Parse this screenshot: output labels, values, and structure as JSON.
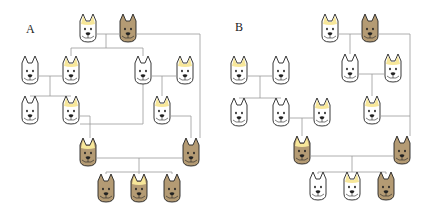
{
  "figure": {
    "colors": {
      "white_coat": "#ffffff",
      "brown_coat": "#b49b74",
      "crest": "#f7e79a",
      "outline": "#222222",
      "line": "#999999"
    },
    "legend_traits": {
      "coat": [
        "white",
        "brown"
      ],
      "crest": [
        "present",
        "absent"
      ]
    }
  },
  "panels": [
    {
      "label": "A",
      "individuals": [
        {
          "id": "A1",
          "generation": 1,
          "coat": "white",
          "crest": true
        },
        {
          "id": "A2",
          "generation": 1,
          "coat": "brown",
          "crest": false
        },
        {
          "id": "A3",
          "generation": 2,
          "coat": "white",
          "crest": false
        },
        {
          "id": "A4",
          "generation": 2,
          "coat": "white",
          "crest": true
        },
        {
          "id": "A5",
          "generation": 2,
          "coat": "white",
          "crest": false
        },
        {
          "id": "A6",
          "generation": 2,
          "coat": "white",
          "crest": true
        },
        {
          "id": "A7",
          "generation": 3,
          "coat": "white",
          "crest": false
        },
        {
          "id": "A8",
          "generation": 3,
          "coat": "white",
          "crest": true
        },
        {
          "id": "A9",
          "generation": 3,
          "coat": "white",
          "crest": true
        },
        {
          "id": "A10",
          "generation": 4,
          "coat": "brown",
          "crest": true
        },
        {
          "id": "A11",
          "generation": 4,
          "coat": "brown",
          "crest": false
        },
        {
          "id": "A12",
          "generation": 5,
          "coat": "brown",
          "crest": false
        },
        {
          "id": "A13",
          "generation": 5,
          "coat": "brown",
          "crest": true
        },
        {
          "id": "A14",
          "generation": 5,
          "coat": "brown",
          "crest": false
        }
      ],
      "matings": [
        {
          "parents": [
            "A1",
            "A2"
          ],
          "children": [
            "A4",
            "A5"
          ]
        },
        {
          "parents": [
            "A3",
            "A4"
          ],
          "children": [
            "A7",
            "A8"
          ]
        },
        {
          "parents": [
            "A5",
            "A6"
          ],
          "children": [
            "A9"
          ]
        },
        {
          "parents": [
            "A8",
            "A5"
          ],
          "children": [
            "A10"
          ]
        },
        {
          "parents": [
            "A9",
            "A2"
          ],
          "children": [
            "A11"
          ]
        },
        {
          "parents": [
            "A10",
            "A11"
          ],
          "children": [
            "A12",
            "A13",
            "A14"
          ]
        }
      ]
    },
    {
      "label": "B",
      "individuals": [
        {
          "id": "B1",
          "generation": 1,
          "coat": "white",
          "crest": true
        },
        {
          "id": "B2",
          "generation": 1,
          "coat": "brown",
          "crest": false
        },
        {
          "id": "B3",
          "generation": 2,
          "coat": "white",
          "crest": true
        },
        {
          "id": "B4",
          "generation": 2,
          "coat": "white",
          "crest": false
        },
        {
          "id": "B5",
          "generation": 2,
          "coat": "white",
          "crest": false
        },
        {
          "id": "B6",
          "generation": 2,
          "coat": "white",
          "crest": true
        },
        {
          "id": "B7",
          "generation": 3,
          "coat": "white",
          "crest": false
        },
        {
          "id": "B8",
          "generation": 3,
          "coat": "white",
          "crest": false
        },
        {
          "id": "B9",
          "generation": 3,
          "coat": "white",
          "crest": true
        },
        {
          "id": "B10",
          "generation": 3,
          "coat": "white",
          "crest": true
        },
        {
          "id": "B11",
          "generation": 4,
          "coat": "brown",
          "crest": true
        },
        {
          "id": "B12",
          "generation": 4,
          "coat": "brown",
          "crest": false
        },
        {
          "id": "B13",
          "generation": 5,
          "coat": "white",
          "crest": false
        },
        {
          "id": "B14",
          "generation": 5,
          "coat": "white",
          "crest": true
        },
        {
          "id": "B15",
          "generation": 5,
          "coat": "brown",
          "crest": false
        }
      ],
      "matings": [
        {
          "parents": [
            "B1",
            "B2"
          ],
          "children": [
            "B5"
          ]
        },
        {
          "parents": [
            "B3",
            "B4"
          ],
          "children": [
            "B7",
            "B8"
          ]
        },
        {
          "parents": [
            "B5",
            "B6"
          ],
          "children": [
            "B10"
          ]
        },
        {
          "parents": [
            "B8",
            "B9"
          ],
          "children": [
            "B11"
          ]
        },
        {
          "parents": [
            "B10",
            "B2"
          ],
          "children": [
            "B12"
          ]
        },
        {
          "parents": [
            "B11",
            "B12"
          ],
          "children": [
            "B13",
            "B14",
            "B15"
          ]
        }
      ]
    }
  ]
}
